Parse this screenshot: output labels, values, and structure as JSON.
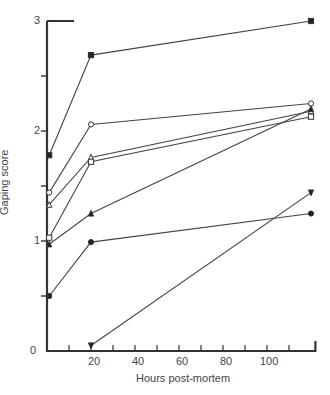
{
  "chart_data": {
    "type": "line",
    "title": "",
    "xlabel": "Hours post-mortem",
    "ylabel": "Gaping score",
    "xlim": [
      0,
      120
    ],
    "ylim": [
      0,
      3
    ],
    "x_ticks": [
      20,
      40,
      60,
      80,
      100
    ],
    "y_ticks": [
      0,
      1,
      2,
      3
    ],
    "grid": false,
    "legend": "none",
    "x": [
      1,
      20,
      120
    ],
    "series": [
      {
        "name": "filled-square",
        "marker": "■",
        "values": [
          1.78,
          2.69,
          3.0
        ]
      },
      {
        "name": "open-circle",
        "marker": "○",
        "values": [
          1.44,
          2.06,
          2.25
        ]
      },
      {
        "name": "open-triangle",
        "marker": "△",
        "values": [
          1.33,
          1.76,
          2.18
        ]
      },
      {
        "name": "open-square",
        "marker": "□",
        "values": [
          1.03,
          1.72,
          2.13
        ]
      },
      {
        "name": "filled-triangle",
        "marker": "▲",
        "values": [
          0.97,
          1.25,
          2.2
        ]
      },
      {
        "name": "filled-circle",
        "marker": "●",
        "values": [
          0.5,
          0.99,
          1.25
        ]
      },
      {
        "name": "filled-inverted-triangle",
        "marker": "▼",
        "values": [
          null,
          0.05,
          1.44
        ]
      }
    ]
  },
  "axis": {
    "ytick_labels": [
      "0",
      "1",
      "2",
      "3"
    ],
    "xtick_labels": [
      "20",
      "40",
      "60",
      "80",
      "100"
    ],
    "xlabel": "Hours post-mortem",
    "ylabel": "Gaping score"
  }
}
